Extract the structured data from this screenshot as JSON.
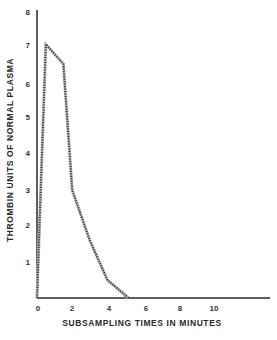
{
  "chart_data": {
    "type": "line",
    "title": "",
    "xlabel": "SUBSAMPLING TIMES IN MINUTES",
    "ylabel": "THROMBIN UNITS OF NORMAL PLASMA",
    "xlim": [
      0,
      13
    ],
    "ylim": [
      0,
      8
    ],
    "x_ticks": [
      "0",
      "2",
      "4",
      "6",
      "8",
      "10"
    ],
    "y_ticks": [
      "1",
      "2",
      "3",
      "4",
      "5",
      "6",
      "7",
      "8"
    ],
    "y_zero_label": "0",
    "grid": false,
    "legend": null,
    "line_style": "dotted-hatched",
    "series": [
      {
        "name": "Thrombin generation",
        "x": [
          0,
          0.5,
          1.5,
          2,
          3,
          4,
          5.2
        ],
        "y": [
          0,
          7.05,
          6.5,
          3.0,
          1.6,
          0.5,
          0
        ]
      }
    ]
  },
  "colors": {
    "line": "#3a3a3a",
    "axis": "#2a2a2a",
    "background": "#ffffff"
  }
}
